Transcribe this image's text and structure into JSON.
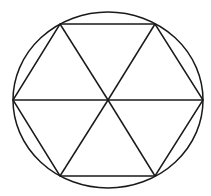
{
  "diagram": {
    "stroke_color": "#1a1a1a",
    "background": "#ffffff",
    "circle": {
      "cx": 108,
      "cy": 100,
      "rx": 95,
      "ry": 88
    },
    "center": {
      "x": 108,
      "y": 100
    },
    "vertices": [
      {
        "name": "top-left",
        "x": 60,
        "y": 24
      },
      {
        "name": "top-right",
        "x": 155,
        "y": 24
      },
      {
        "name": "right",
        "x": 203,
        "y": 100
      },
      {
        "name": "bottom-right",
        "x": 155,
        "y": 176
      },
      {
        "name": "bottom-left",
        "x": 60,
        "y": 176
      },
      {
        "name": "left",
        "x": 13,
        "y": 100
      }
    ]
  }
}
